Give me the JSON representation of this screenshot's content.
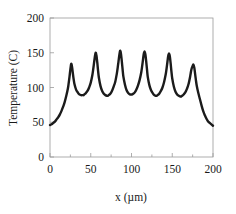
{
  "chart_data": {
    "type": "line",
    "title": "",
    "subtitle": "",
    "xlabel": "x (µm)",
    "ylabel": "Temperature (C)",
    "xlim": [
      0,
      200
    ],
    "ylim": [
      0,
      200
    ],
    "xticks": [
      0,
      50,
      100,
      150,
      200
    ],
    "yticks": [
      0,
      50,
      100,
      150,
      200
    ],
    "xtick_labels": [
      "0",
      "50",
      "100",
      "150",
      "200"
    ],
    "ytick_labels": [
      "0",
      "50",
      "100",
      "150",
      "200"
    ],
    "x_minor_ticks": [
      25,
      75,
      125,
      175
    ],
    "grid": false,
    "legend": null,
    "legend_position": "none",
    "line_color": "#1b1b1b",
    "line_width": 2.4,
    "frame_color": "#9a9a9a",
    "annotations": [],
    "peaks": {
      "positions_um": [
        26,
        56,
        86,
        116,
        146,
        176
      ],
      "values_C": [
        134,
        150,
        153,
        152,
        149,
        133
      ]
    },
    "valleys": {
      "positions_um": [
        41,
        71,
        101,
        131,
        161
      ],
      "values_C": [
        89,
        88,
        90,
        88,
        87
      ]
    },
    "endpoints": {
      "left_C": 46,
      "right_C": 45
    },
    "series": [
      {
        "name": "Temperature profile",
        "x": [
          0,
          2,
          4,
          6,
          8,
          10,
          12,
          14,
          16,
          18,
          20,
          22,
          23,
          24,
          25,
          26,
          27,
          28,
          29,
          30,
          32,
          34,
          36,
          38,
          40,
          41,
          42,
          44,
          46,
          48,
          50,
          52,
          53,
          54,
          55,
          56,
          57,
          58,
          59,
          60,
          62,
          64,
          66,
          68,
          70,
          71,
          72,
          74,
          76,
          78,
          80,
          82,
          83,
          84,
          85,
          86,
          87,
          88,
          89,
          90,
          92,
          94,
          96,
          98,
          100,
          101,
          102,
          104,
          106,
          108,
          110,
          112,
          113,
          114,
          115,
          116,
          117,
          118,
          119,
          120,
          122,
          124,
          126,
          128,
          130,
          131,
          132,
          134,
          136,
          138,
          140,
          142,
          143,
          144,
          145,
          146,
          147,
          148,
          149,
          150,
          152,
          154,
          156,
          158,
          160,
          161,
          162,
          164,
          166,
          168,
          170,
          172,
          173,
          174,
          175,
          176,
          177,
          178,
          179,
          180,
          182,
          184,
          186,
          188,
          190,
          192,
          194,
          196,
          198,
          200
        ],
        "y": [
          46,
          47,
          49,
          51,
          54,
          57,
          61,
          66,
          72,
          79,
          88,
          99,
          107,
          116,
          126,
          134,
          130,
          121,
          112,
          105,
          97,
          93,
          90,
          89,
          89,
          89,
          90,
          92,
          95,
          100,
          107,
          118,
          126,
          135,
          144,
          150,
          146,
          136,
          124,
          114,
          102,
          95,
          91,
          89,
          88,
          88,
          89,
          91,
          95,
          101,
          108,
          120,
          128,
          137,
          146,
          153,
          149,
          139,
          127,
          116,
          104,
          96,
          92,
          90,
          90,
          90,
          91,
          93,
          97,
          103,
          111,
          122,
          130,
          139,
          148,
          152,
          148,
          138,
          126,
          115,
          103,
          96,
          92,
          89,
          88,
          88,
          89,
          91,
          95,
          100,
          108,
          119,
          127,
          136,
          145,
          149,
          145,
          135,
          123,
          113,
          101,
          94,
          90,
          88,
          87,
          87,
          88,
          90,
          93,
          98,
          105,
          116,
          123,
          128,
          131,
          133,
          129,
          120,
          111,
          103,
          92,
          83,
          74,
          66,
          60,
          55,
          51,
          49,
          47,
          45
        ]
      }
    ]
  }
}
